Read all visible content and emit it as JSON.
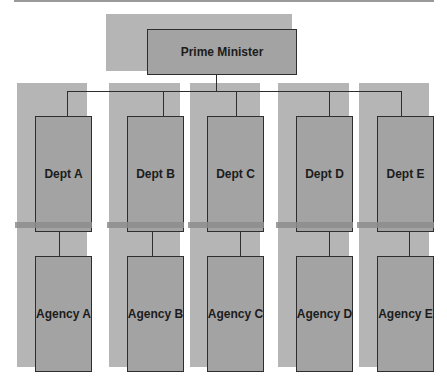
{
  "diagram": {
    "type": "org-chart",
    "root": {
      "label": "Prime Minister"
    },
    "departments": [
      {
        "label": "Dept A",
        "agency": "Agency A"
      },
      {
        "label": "Dept B",
        "agency": "Agency B"
      },
      {
        "label": "Dept C",
        "agency": "Agency C"
      },
      {
        "label": "Dept D",
        "agency": "Agency D"
      },
      {
        "label": "Dept E",
        "agency": "Agency E"
      }
    ]
  },
  "colors": {
    "shadow": "#b5b5b5",
    "box": "#a3a3a3",
    "border": "#2e2e2e",
    "band": "#8d8d8d",
    "text": "#1c1c1c"
  }
}
